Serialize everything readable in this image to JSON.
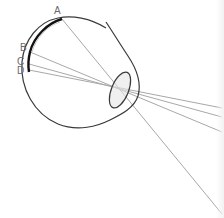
{
  "diagram": {
    "labels": [
      {
        "id": "A",
        "text": "A",
        "x": 54,
        "y": 14
      },
      {
        "id": "B",
        "text": "B",
        "x": 20,
        "y": 51
      },
      {
        "id": "C",
        "text": "C",
        "x": 17,
        "y": 64
      },
      {
        "id": "D",
        "text": "D",
        "x": 17,
        "y": 73
      }
    ],
    "colors": {
      "outline": "#3a3a3a",
      "retina": "#111111",
      "rays": "#a8a8a8",
      "lens_fill": "#e6e6e6",
      "label": "#6a6a6a"
    }
  }
}
